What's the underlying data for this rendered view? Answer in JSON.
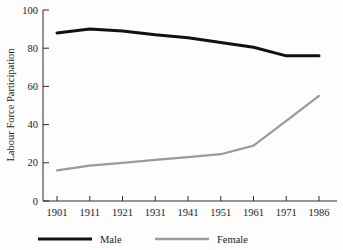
{
  "chart_data": {
    "type": "line",
    "title": "",
    "xlabel": "",
    "ylabel": "Labour Force Participation",
    "categories": [
      "1901",
      "1911",
      "1921",
      "1931",
      "1941",
      "1951",
      "1961",
      "1971",
      "1986"
    ],
    "ylim": [
      0,
      100
    ],
    "yticks": [
      0,
      20,
      40,
      60,
      80,
      100
    ],
    "ytick_labels": [
      "0",
      "20",
      "40",
      "60",
      "80",
      "100"
    ],
    "grid": false,
    "legend_position": "bottom",
    "series": [
      {
        "name": "Male",
        "color": "#111111",
        "line_width": 3,
        "values": [
          88,
          90,
          89,
          87,
          85.5,
          83,
          80.5,
          76,
          76
        ]
      },
      {
        "name": "Female",
        "color": "#9a9a9a",
        "line_width": 2.2,
        "values": [
          16,
          18.5,
          20,
          21.5,
          23,
          24.5,
          29,
          42,
          55
        ]
      }
    ]
  },
  "legend": {
    "items": [
      {
        "label": "Male",
        "color": "#111111"
      },
      {
        "label": "Female",
        "color": "#9a9a9a"
      }
    ]
  }
}
